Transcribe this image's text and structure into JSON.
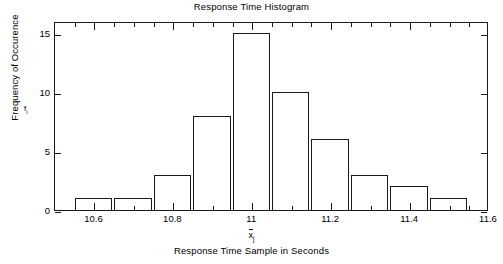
{
  "chart_data": {
    "type": "bar",
    "title": "Response Time Histogram",
    "xlabel": "Response Time Sample in Seconds",
    "xlabel_symbol_base": "x",
    "xlabel_symbol_sub": "j",
    "ylabel": "Frequency of Occurence",
    "ylabel_symbol_base": "f",
    "ylabel_symbol_sub": "i",
    "categories": [
      "10.55",
      "10.65",
      "10.75",
      "10.85",
      "10.95",
      "11.05",
      "11.15",
      "11.25",
      "11.35",
      "11.45"
    ],
    "bin_centers": [
      10.6,
      10.7,
      10.8,
      10.9,
      11.0,
      11.1,
      11.2,
      11.3,
      11.4,
      11.5
    ],
    "bin_edges": [
      10.55,
      10.65,
      10.75,
      10.85,
      10.95,
      11.05,
      11.15,
      11.25,
      11.35,
      11.45,
      11.55
    ],
    "values": [
      1,
      1,
      3,
      8,
      15,
      10,
      6,
      3,
      2,
      1
    ],
    "xlim": [
      10.5,
      11.6
    ],
    "ylim": [
      0,
      16
    ],
    "xticks": [
      10.6,
      10.8,
      11.0,
      11.2,
      11.4,
      11.6
    ],
    "xtick_labels": [
      "10.6",
      "10.8",
      "11",
      "11.2",
      "11.4",
      "11.6"
    ],
    "xminor_step": 0.05,
    "yticks": [
      0,
      5,
      10,
      15
    ],
    "ytick_labels": [
      "0",
      "5",
      "10",
      "15"
    ],
    "grid": false,
    "legend": null,
    "bar_fill": "none",
    "bar_edge_color": "#1a1a1a",
    "axis_color": "#1a1a1a",
    "background": "#ffffff"
  }
}
